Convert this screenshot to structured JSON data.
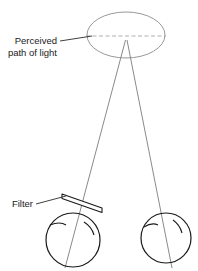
{
  "figure": {
    "background_color": "#ffffff",
    "width": 198,
    "height": 271,
    "labels": {
      "perceived_line1": "Perceived",
      "perceived_line2": "path of light",
      "filter": "Filter"
    },
    "colors": {
      "stroke_dark": "#1a1a1a",
      "stroke_light": "#8c8c8c",
      "stroke_medium": "#7a7a7a",
      "dashed": "#9a9a9a",
      "text": "#1a1a1a",
      "leader": "#2b2b2b"
    },
    "geometry": {
      "ellipse": {
        "cx": 126,
        "cy": 35,
        "rx": 39,
        "ry": 23
      },
      "dashed_axis": {
        "x1": 87,
        "y1": 36,
        "x2": 165,
        "y2": 36
      },
      "apex": {
        "x": 126,
        "y": 40
      },
      "left_eye": {
        "cx": 73,
        "cy": 240,
        "r": 27
      },
      "right_eye": {
        "cx": 166,
        "cy": 238,
        "r": 25
      },
      "filter_plate": {
        "x1": 64,
        "y1": 196,
        "x2": 104,
        "y2": 212,
        "thickness": 5
      }
    },
    "elements": [
      "perceived-path-ellipse",
      "dashed-center-axis",
      "left-light-ray",
      "right-light-ray",
      "filter-plate",
      "left-eye",
      "right-eye",
      "perceived-path-label",
      "filter-label"
    ]
  }
}
